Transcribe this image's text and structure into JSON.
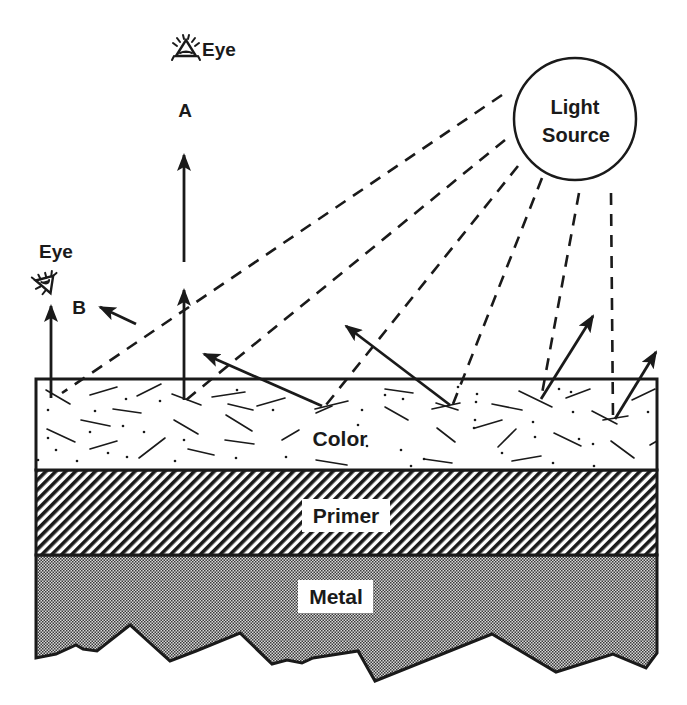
{
  "diagram": {
    "light_source": {
      "label_line1": "Light",
      "label_line2": "Source"
    },
    "observers": [
      {
        "id": "A",
        "eye_label": "Eye",
        "position_label": "A"
      },
      {
        "id": "B",
        "eye_label": "Eye",
        "position_label": "B"
      }
    ],
    "layers": [
      {
        "name": "color",
        "label": "Color",
        "pattern": "flakes"
      },
      {
        "name": "primer",
        "label": "Primer",
        "pattern": "diagonal-hatch"
      },
      {
        "name": "metal",
        "label": "Metal",
        "pattern": "stipple"
      }
    ],
    "colors": {
      "ink": "#1a1a1a",
      "background": "#ffffff",
      "metal_fill": "#9a9a9a"
    }
  }
}
